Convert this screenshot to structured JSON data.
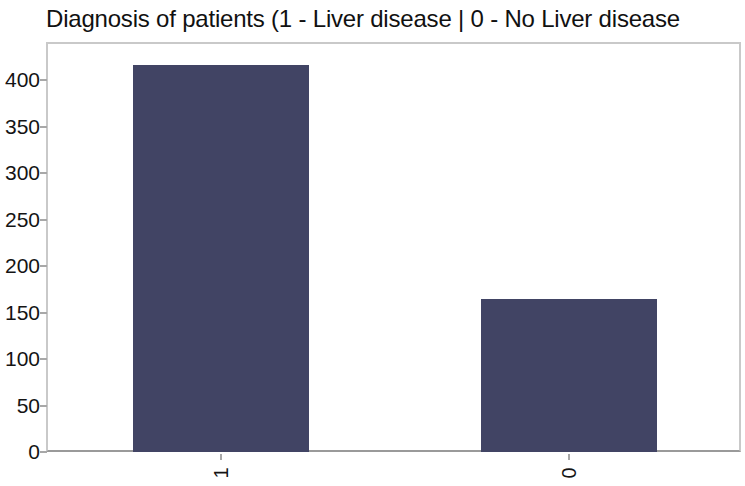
{
  "chart_data": {
    "type": "bar",
    "title": "Diagnosis of patients (1 - Liver disease | 0 - No Liver disease",
    "title_truncated": true,
    "xlabel": "",
    "ylabel": "",
    "categories": [
      "1",
      "0"
    ],
    "values": [
      416,
      165
    ],
    "series": [
      {
        "name": "Count of patients",
        "values": [
          416,
          165
        ]
      }
    ],
    "ylim": [
      0,
      440
    ],
    "y_ticks": [
      0,
      50,
      100,
      150,
      200,
      250,
      300,
      350,
      400
    ],
    "y_tick_labels": [
      "0",
      "50",
      "100",
      "150",
      "200",
      "250",
      "300",
      "350",
      "400"
    ],
    "x_tick_labels": [
      "1",
      "0"
    ],
    "x_tick_label_rotation": -90,
    "grid": false,
    "legend": false,
    "legend_position": "none",
    "bar_color": "#414464",
    "plot_border_color": "#c9c9c9",
    "axis_color": "#9a9a9a",
    "background_color": "#ffffff",
    "text_color": "#141414"
  }
}
